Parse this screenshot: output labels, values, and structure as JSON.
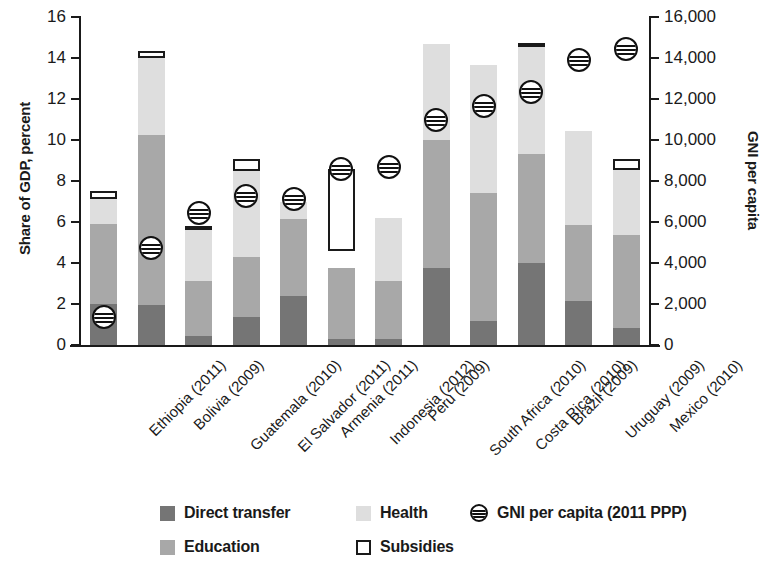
{
  "chart_data": {
    "type": "bar",
    "title": "",
    "subtitle": "",
    "stacked": true,
    "ylabel": "Share of GDP, percent",
    "ylabel_right": "GNI per capita",
    "xlabel": "",
    "ylim": [
      0,
      16
    ],
    "ylim_right": [
      0,
      16000
    ],
    "grid": false,
    "legend_position": "bottom",
    "ytick_labels": [
      "0",
      "2",
      "4",
      "6",
      "8",
      "10",
      "12",
      "14",
      "16"
    ],
    "ytick_values": [
      0,
      2,
      4,
      6,
      8,
      10,
      12,
      14,
      16
    ],
    "ytick_labels_right": [
      "0",
      "2,000",
      "4,000",
      "6,000",
      "8,000",
      "10,000",
      "12,000",
      "14,000",
      "16,000"
    ],
    "ytick_values_right": [
      0,
      2000,
      4000,
      6000,
      8000,
      10000,
      12000,
      14000,
      16000
    ],
    "categories": [
      "Ethiopia (2011)",
      "Bolivia (2009)",
      "Guatemala (2010)",
      "El Salvador (2011)",
      "Armenia (2011)",
      "Indonesia (2012)",
      "Peru (2009)",
      "South Africa (2010)",
      "Costa Rica (2010)",
      "Brazil (2009)",
      "Uruguay (2009)",
      "Mexico (2010)"
    ],
    "series": [
      {
        "name": "Direct transfer",
        "color": "#757575",
        "values": [
          2.0,
          1.95,
          0.45,
          1.35,
          2.4,
          0.3,
          0.3,
          3.75,
          1.15,
          4.0,
          2.15,
          0.85
        ]
      },
      {
        "name": "Education",
        "color": "#a8a8a8",
        "values": [
          3.9,
          8.3,
          2.65,
          2.95,
          3.75,
          3.45,
          2.8,
          6.25,
          6.25,
          5.3,
          3.7,
          4.5
        ]
      },
      {
        "name": "Health",
        "color": "#dedede",
        "values": [
          1.2,
          3.75,
          2.5,
          4.2,
          0.85,
          0.0,
          3.1,
          4.7,
          6.25,
          5.4,
          4.6,
          3.7
        ]
      }
    ],
    "subsidies": {
      "name": "Subsidies",
      "bars": [
        {
          "category": "Ethiopia (2011)",
          "bottom": 7.1,
          "top": 7.5
        },
        {
          "category": "Bolivia (2009)",
          "bottom": 14.0,
          "top": 14.35
        },
        {
          "category": "Guatemala (2010)",
          "bottom": 5.6,
          "top": 5.8
        },
        {
          "category": "El Salvador (2011)",
          "bottom": 8.5,
          "top": 9.05
        },
        {
          "category": "Armenia (2011)",
          "bottom": null,
          "top": null
        },
        {
          "category": "Indonesia (2012)",
          "bottom": 4.6,
          "top": 8.6
        },
        {
          "category": "Peru (2009)",
          "bottom": null,
          "top": null
        },
        {
          "category": "South Africa (2010)",
          "bottom": null,
          "top": null
        },
        {
          "category": "Costa Rica (2010)",
          "bottom": null,
          "top": null
        },
        {
          "category": "Brazil (2009)",
          "bottom": 14.65,
          "top": 14.75
        },
        {
          "category": "Uruguay (2009)",
          "bottom": null,
          "top": null
        },
        {
          "category": "Mexico (2010)",
          "bottom": 8.55,
          "top": 9.05
        }
      ]
    },
    "gni_per_capita": {
      "name": "GNI per capita (2011 PPP)",
      "axis": "right",
      "values": [
        1350,
        4750,
        6450,
        7250,
        7100,
        8600,
        8700,
        11000,
        11650,
        12350,
        13900,
        14450
      ]
    }
  },
  "legend": {
    "items": [
      {
        "label": "Direct transfer",
        "swatch": "transfer"
      },
      {
        "label": "Health",
        "swatch": "health"
      },
      {
        "label": "GNI per capita (2011 PPP)",
        "swatch": "gni"
      },
      {
        "label": "Education",
        "swatch": "education"
      },
      {
        "label": "Subsidies",
        "swatch": "subsidies"
      }
    ]
  }
}
